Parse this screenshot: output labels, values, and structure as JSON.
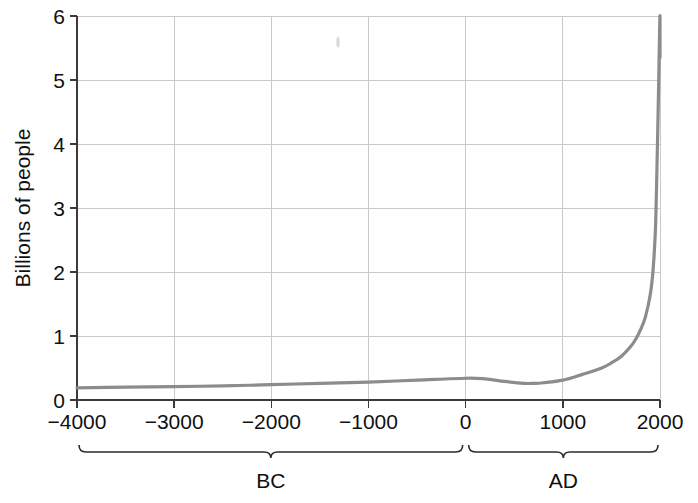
{
  "chart_data": {
    "type": "line",
    "title": "",
    "subtitle": "",
    "xlabel": "",
    "ylabel": "Billions of people",
    "xlim": [
      -4000,
      2000
    ],
    "ylim": [
      0,
      6
    ],
    "grid": true,
    "legend": "none",
    "x_ticks": [
      -4000,
      -3000,
      -2000,
      -1000,
      0,
      1000,
      2000
    ],
    "x_tick_labels": [
      "−4000",
      "−3000",
      "−2000",
      "−1000",
      "0",
      "1000",
      "2000"
    ],
    "y_ticks": [
      0,
      1,
      2,
      3,
      4,
      5,
      6
    ],
    "y_tick_labels": [
      "0",
      "1",
      "2",
      "3",
      "4",
      "5",
      "6"
    ],
    "series": [
      {
        "name": "World population",
        "color": "#8c8c8c",
        "x": [
          -4000,
          -3500,
          -3000,
          -2500,
          -2000,
          -1500,
          -1000,
          -500,
          0,
          200,
          400,
          600,
          700,
          800,
          1000,
          1200,
          1400,
          1500,
          1600,
          1700,
          1750,
          1800,
          1850,
          1900,
          1927,
          1950,
          1960,
          1975,
          1987,
          1999,
          2000
        ],
        "y": [
          0.19,
          0.2,
          0.21,
          0.22,
          0.24,
          0.26,
          0.28,
          0.31,
          0.34,
          0.33,
          0.29,
          0.26,
          0.26,
          0.27,
          0.31,
          0.4,
          0.5,
          0.58,
          0.68,
          0.84,
          0.95,
          1.1,
          1.3,
          1.65,
          2.0,
          2.56,
          3.03,
          4.07,
          5.0,
          6.0,
          5.35
        ]
      }
    ],
    "annotations": [
      {
        "id": "era-bc",
        "label": "BC",
        "from": -4000,
        "to": 0
      },
      {
        "id": "era-ad",
        "label": "AD",
        "from": 0,
        "to": 2000
      }
    ],
    "axis_color": "#3a3a3a",
    "grid_color": "#c9c9c9",
    "series_color": "#8c8c8c",
    "background": "#ffffff"
  }
}
